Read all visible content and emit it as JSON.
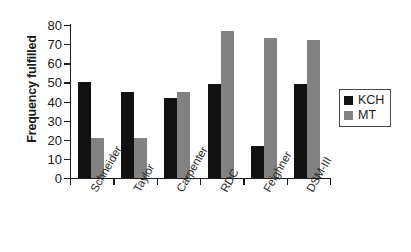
{
  "chart_data": {
    "type": "bar",
    "title": "",
    "subtitle": "",
    "xlabel": "",
    "ylabel": "Frequency fulfilled",
    "categories": [
      "Schneider",
      "Taylor",
      "Carpenter",
      "RDC",
      "Feighner",
      "DSM-III"
    ],
    "series": [
      {
        "name": "KCH",
        "color": "#111111",
        "values": [
          50,
          45,
          42,
          49,
          17,
          49
        ]
      },
      {
        "name": "MT",
        "color": "#828282",
        "values": [
          21,
          21,
          45,
          77,
          73,
          72
        ]
      }
    ],
    "ylim": [
      0,
      80
    ],
    "ytick_step": 10,
    "yticks": [
      0,
      10,
      20,
      30,
      40,
      50,
      60,
      70,
      80
    ],
    "ytick_labels": [
      "0",
      "10",
      "20",
      "30",
      "40",
      "50",
      "60",
      "70",
      "80"
    ],
    "grid": false,
    "legend_position": "right",
    "xtick_label_rotation": -60
  },
  "legend": {
    "entries": [
      {
        "label": "KCH",
        "color": "#111111"
      },
      {
        "label": "MT",
        "color": "#828282"
      }
    ]
  },
  "axis": {
    "y_title": "Frequency fulfilled"
  }
}
